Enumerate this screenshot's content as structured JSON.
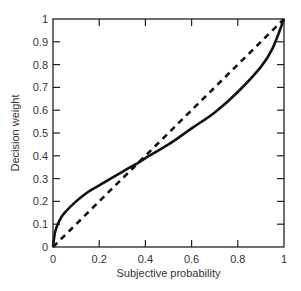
{
  "chart_data": {
    "type": "line",
    "title": "",
    "xlabel": "Subjective probability",
    "ylabel": "Decision weight",
    "xlim": [
      0,
      1
    ],
    "ylim": [
      0,
      1
    ],
    "grid": false,
    "legend": null,
    "x_ticks": [
      "0",
      "0.2",
      "0.4",
      "0.6",
      "0.8",
      "1"
    ],
    "y_ticks": [
      "0",
      "0.1",
      "0.2",
      "0.3",
      "0.4",
      "0.5",
      "0.6",
      "0.7",
      "0.8",
      "0.9",
      "1"
    ],
    "series": [
      {
        "name": "Decision weight function",
        "style": "solid",
        "color": "#111111",
        "x": [
          0,
          0.01,
          0.03,
          0.05,
          0.1,
          0.15,
          0.2,
          0.3,
          0.37,
          0.4,
          0.5,
          0.6,
          0.7,
          0.8,
          0.9,
          0.95,
          1
        ],
        "y": [
          0,
          0.07,
          0.12,
          0.15,
          0.2,
          0.24,
          0.27,
          0.33,
          0.37,
          0.39,
          0.45,
          0.52,
          0.59,
          0.68,
          0.79,
          0.87,
          1
        ]
      },
      {
        "name": "Identity (w = p)",
        "style": "dashed",
        "color": "#111111",
        "x": [
          0,
          1
        ],
        "y": [
          0,
          1
        ]
      }
    ]
  }
}
